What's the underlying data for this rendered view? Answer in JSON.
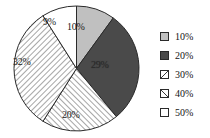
{
  "chart_data": {
    "type": "pie",
    "title": "",
    "subtitle": "",
    "xlabel": "",
    "ylabel": "",
    "grid": false,
    "legend_position": "right",
    "start_angle_deg": 0,
    "direction": "clockwise",
    "categories": [
      "10%",
      "20%",
      "30%",
      "40%",
      "50%"
    ],
    "values": [
      10,
      29,
      20,
      32,
      9
    ],
    "data_labels": [
      "10%",
      "29%",
      "20%",
      "32%",
      "9%"
    ],
    "slices": [
      {
        "legend_label": "10%",
        "data_label": "10%",
        "value": 10,
        "fill_style": "solid-light-gray",
        "color": "#c0c0c0",
        "label_left": 67,
        "label_top": 22,
        "on_dark": false
      },
      {
        "legend_label": "20%",
        "data_label": "29%",
        "value": 29,
        "fill_style": "solid-dark-gray",
        "color": "#4a4a4a",
        "label_left": 91,
        "label_top": 60,
        "on_dark": true
      },
      {
        "legend_label": "30%",
        "data_label": "20%",
        "value": 20,
        "fill_style": "hatch-up-right",
        "color": "#ffffff",
        "label_left": 62,
        "label_top": 110,
        "on_dark": false
      },
      {
        "legend_label": "40%",
        "data_label": "32%",
        "value": 32,
        "fill_style": "hatch-down-right",
        "color": "#ffffff",
        "label_left": 13,
        "label_top": 57,
        "on_dark": false
      },
      {
        "legend_label": "50%",
        "data_label": "9%",
        "value": 9,
        "fill_style": "empty-white",
        "color": "#ffffff",
        "label_left": 43,
        "label_top": 17,
        "on_dark": false
      }
    ]
  },
  "legend": {
    "items": [
      {
        "label": "10%",
        "fill_style": "solid-light-gray",
        "color": "#c0c0c0"
      },
      {
        "label": "20%",
        "fill_style": "solid-dark-gray",
        "color": "#4a4a4a"
      },
      {
        "label": "30%",
        "fill_style": "hatch-up-right",
        "color": "#ffffff"
      },
      {
        "label": "40%",
        "fill_style": "hatch-down-right",
        "color": "#ffffff"
      },
      {
        "label": "50%",
        "fill_style": "empty-white",
        "color": "#ffffff"
      }
    ]
  },
  "style": {
    "outline_color": "#2a2a2a",
    "background": "#ffffff",
    "light_gray": "#c0c0c0",
    "dark_gray": "#4a4a4a"
  }
}
